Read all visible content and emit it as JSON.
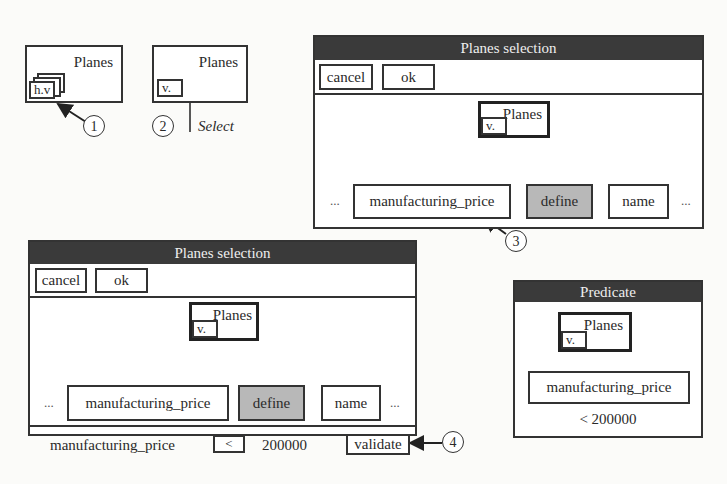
{
  "step1": {
    "box_label": "Planes",
    "tag": "h.v",
    "marker": "1"
  },
  "step2": {
    "box_label": "Planes",
    "tag": "v.",
    "marker": "2",
    "action": "Select"
  },
  "selection_window_top": {
    "title": "Planes selection",
    "buttons": {
      "cancel": "cancel",
      "ok": "ok"
    },
    "root": {
      "label": "Planes",
      "tag": "v."
    },
    "left_ellipsis": "...",
    "right_ellipsis": "...",
    "children": [
      {
        "label": "manufacturing_price",
        "highlighted": false
      },
      {
        "label": "define",
        "highlighted": true
      },
      {
        "label": "name",
        "highlighted": false
      }
    ],
    "marker": "3"
  },
  "selection_window_bottom": {
    "title": "Planes selection",
    "buttons": {
      "cancel": "cancel",
      "ok": "ok"
    },
    "root": {
      "label": "Planes",
      "tag": "v."
    },
    "left_ellipsis": "...",
    "right_ellipsis": "...",
    "children": [
      {
        "label": "manufacturing_price",
        "highlighted": false
      },
      {
        "label": "define",
        "highlighted": true
      },
      {
        "label": "name",
        "highlighted": false
      }
    ],
    "condition": {
      "attribute": "manufacturing_price",
      "operator": "<",
      "value": "200000",
      "validate_label": "validate"
    },
    "marker": "4"
  },
  "predicate_window": {
    "title": "Predicate",
    "root": {
      "label": "Planes",
      "tag": "v."
    },
    "attribute": "manufacturing_price",
    "condition": "< 200000"
  },
  "colors": {
    "titlebar": "#3a3a3a",
    "highlight_node": "#b8b8b8",
    "border": "#333333"
  }
}
